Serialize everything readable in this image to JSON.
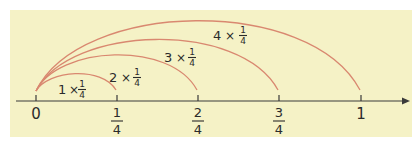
{
  "diagram": {
    "type": "number-line-jumps",
    "background_color": "#f5f2c6",
    "arc_color": "#d98870",
    "axis_color": "#3a3a3a",
    "axis": {
      "ticks": [
        {
          "label": "0",
          "x": 36
        },
        {
          "numerator": "1",
          "denominator": "4",
          "x": 117
        },
        {
          "numerator": "2",
          "denominator": "4",
          "x": 198
        },
        {
          "numerator": "3",
          "denominator": "4",
          "x": 279
        },
        {
          "label": "1",
          "x": 361
        }
      ],
      "arrow": "right"
    },
    "jumps": [
      {
        "multiplier": "1",
        "times": "×",
        "numerator": "1",
        "denominator": "4",
        "from": "0",
        "to": "1/4"
      },
      {
        "multiplier": "2",
        "times": "×",
        "numerator": "1",
        "denominator": "4",
        "from": "0",
        "to": "2/4"
      },
      {
        "multiplier": "3",
        "times": "×",
        "numerator": "1",
        "denominator": "4",
        "from": "0",
        "to": "3/4"
      },
      {
        "multiplier": "4",
        "times": "×",
        "numerator": "1",
        "denominator": "4",
        "from": "0",
        "to": "1"
      }
    ]
  }
}
